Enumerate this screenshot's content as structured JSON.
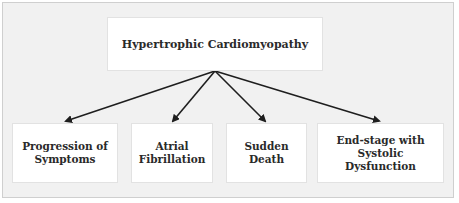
{
  "diagram": {
    "root": {
      "label": "Hypertrophic Cardiomyopathy"
    },
    "children": [
      {
        "label": "Progression of\nSymptoms"
      },
      {
        "label": "Atrial\nFibrillation"
      },
      {
        "label": "Sudden\nDeath"
      },
      {
        "label": "End-stage with\nSystolic\nDysfunction"
      }
    ],
    "edge_color": "#1e1e1e",
    "background_color": "#f1f1f1",
    "node_color": "#ffffff"
  }
}
